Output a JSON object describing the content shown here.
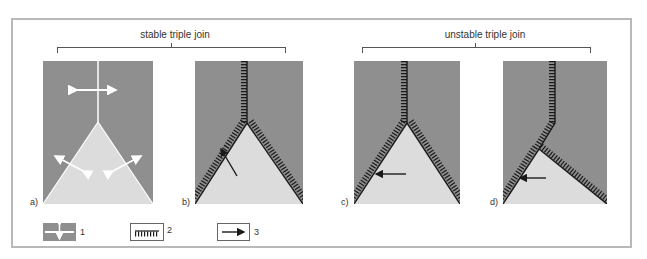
{
  "figure": {
    "groups": [
      {
        "id": "stable",
        "title": "stable triple join"
      },
      {
        "id": "unstable",
        "title": "unstable triple join"
      }
    ],
    "panels": [
      {
        "label": "a)",
        "description": "grain boundaries with white outward arrows"
      },
      {
        "label": "b)",
        "description": "hatched boundaries with diagonal arrow"
      },
      {
        "label": "c)",
        "description": "hatched boundaries with leftward arrow"
      },
      {
        "label": "d)",
        "description": "asymmetric hatched boundaries with leftward arrow"
      }
    ],
    "legend": [
      {
        "number": "1",
        "icon": "double-arrow-grain-icon"
      },
      {
        "number": "2",
        "icon": "hatched-boundary-icon"
      },
      {
        "number": "3",
        "icon": "arrow-right-icon"
      }
    ],
    "colors": {
      "dark_grain": "#8f8f8f",
      "light_grain": "#dcdcdc",
      "boundary": "#1a1a1a",
      "frame": "#b9b9b9"
    }
  }
}
